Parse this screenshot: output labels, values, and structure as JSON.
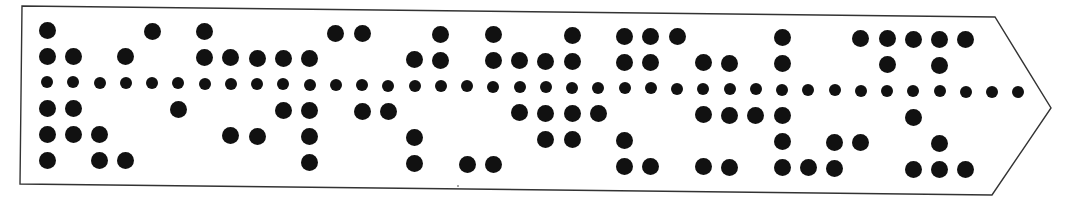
{
  "tape": {
    "description": "Punched paper tape, 5 data tracks plus sprocket track, arrow-shaped leading end pointing right",
    "colors": {
      "paper": "#ffffff",
      "outline": "#333333",
      "hole": "#111111"
    },
    "outline_points": [
      [
        22,
        6
      ],
      [
        995,
        17
      ],
      [
        1051,
        108
      ],
      [
        992,
        195
      ],
      [
        20,
        184
      ]
    ],
    "tracks": [
      "1",
      "2",
      "sprocket",
      "4",
      "5",
      "6"
    ],
    "column_count": 38,
    "first_column_x": 47,
    "column_pitch": 26.25,
    "row_y_left": [
      30,
      56,
      82,
      108,
      134,
      160
    ],
    "row_drift_per_px": 0.0105,
    "columns": [
      {
        "col": 0,
        "holes": [
          1,
          2,
          4,
          5,
          6
        ]
      },
      {
        "col": 1,
        "holes": [
          2,
          4,
          5
        ]
      },
      {
        "col": 2,
        "holes": [
          5,
          6
        ]
      },
      {
        "col": 3,
        "holes": [
          2,
          6
        ]
      },
      {
        "col": 4,
        "holes": [
          1
        ]
      },
      {
        "col": 5,
        "holes": [
          4
        ]
      },
      {
        "col": 6,
        "holes": [
          1,
          2
        ]
      },
      {
        "col": 7,
        "holes": [
          2,
          5
        ]
      },
      {
        "col": 8,
        "holes": [
          2,
          5
        ]
      },
      {
        "col": 9,
        "holes": [
          2,
          4
        ]
      },
      {
        "col": 10,
        "holes": [
          2,
          4,
          5,
          6
        ]
      },
      {
        "col": 11,
        "holes": [
          1
        ]
      },
      {
        "col": 12,
        "holes": [
          1,
          4
        ]
      },
      {
        "col": 13,
        "holes": [
          4
        ]
      },
      {
        "col": 14,
        "holes": [
          2,
          5,
          6
        ]
      },
      {
        "col": 15,
        "holes": [
          1,
          2
        ]
      },
      {
        "col": 16,
        "holes": [
          6
        ]
      },
      {
        "col": 17,
        "holes": [
          1,
          2,
          6
        ]
      },
      {
        "col": 18,
        "holes": [
          2,
          4
        ]
      },
      {
        "col": 19,
        "holes": [
          2,
          4,
          5
        ]
      },
      {
        "col": 20,
        "holes": [
          1,
          2,
          4,
          5
        ]
      },
      {
        "col": 21,
        "holes": [
          4
        ]
      },
      {
        "col": 22,
        "holes": [
          1,
          2,
          5,
          6
        ]
      },
      {
        "col": 23,
        "holes": [
          1,
          2,
          6
        ]
      },
      {
        "col": 24,
        "holes": [
          1
        ]
      },
      {
        "col": 25,
        "holes": [
          2,
          4,
          6
        ]
      },
      {
        "col": 26,
        "holes": [
          2,
          4,
          6
        ]
      },
      {
        "col": 27,
        "holes": [
          4
        ]
      },
      {
        "col": 28,
        "holes": [
          1,
          2,
          4,
          5,
          6
        ]
      },
      {
        "col": 29,
        "holes": [
          6
        ]
      },
      {
        "col": 30,
        "holes": [
          5,
          6
        ]
      },
      {
        "col": 31,
        "holes": [
          1,
          5
        ]
      },
      {
        "col": 32,
        "holes": [
          1,
          2
        ]
      },
      {
        "col": 33,
        "holes": [
          1,
          4,
          6
        ]
      },
      {
        "col": 34,
        "holes": [
          1,
          2,
          5,
          6
        ]
      },
      {
        "col": 35,
        "holes": [
          1,
          6
        ]
      },
      {
        "col": 36,
        "holes": []
      },
      {
        "col": 37,
        "holes": []
      }
    ]
  }
}
